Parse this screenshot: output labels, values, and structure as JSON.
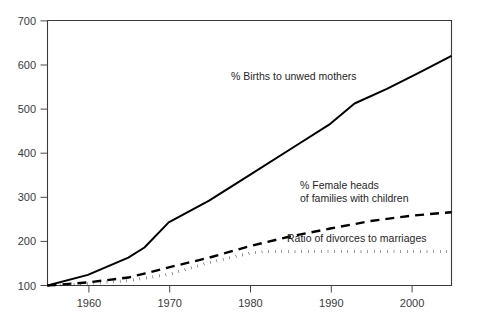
{
  "chart_data": {
    "type": "line",
    "title": "",
    "subtitle": "",
    "xlabel": "",
    "ylabel": "",
    "xlim": [
      1955,
      2005
    ],
    "ylim": [
      100,
      700
    ],
    "grid": false,
    "legend_position": "inline-annotations",
    "x_ticks": [
      "1960",
      "1970",
      "1980",
      "1990",
      "2000"
    ],
    "x_tick_values": [
      1960,
      1970,
      1980,
      1990,
      2000
    ],
    "y_ticks": [
      "100",
      "200",
      "300",
      "400",
      "500",
      "600",
      "700"
    ],
    "y_tick_values": [
      100,
      200,
      300,
      400,
      500,
      600,
      700
    ],
    "series": [
      {
        "name": "% Births to unwed mothers",
        "style": "solid",
        "x": [
          1955,
          1960,
          1965,
          1967,
          1970,
          1975,
          1980,
          1985,
          1990,
          1993,
          1997,
          2001,
          2005
        ],
        "values": [
          100,
          124,
          163,
          186,
          243,
          292,
          350,
          408,
          466,
          512,
          545,
          582,
          620
        ]
      },
      {
        "name": "% Female heads of families with children",
        "style": "dashed",
        "x": [
          1955,
          1960,
          1965,
          1967,
          1970,
          1975,
          1980,
          1985,
          1990,
          1995,
          2000,
          2005
        ],
        "values": [
          100,
          107,
          118,
          127,
          141,
          163,
          189,
          211,
          229,
          246,
          258,
          266
        ]
      },
      {
        "name": "Ratio of divorces to marriages",
        "style": "dotted",
        "x": [
          1955,
          1960,
          1965,
          1970,
          1975,
          1980,
          1982,
          1985,
          1990,
          1995,
          2000,
          2005
        ],
        "values": [
          100,
          104,
          111,
          125,
          152,
          173,
          177,
          177,
          177,
          177,
          177,
          177
        ]
      }
    ],
    "annotations": [
      {
        "id": "annotation-unwed-mothers",
        "lines": [
          "% Births to unwed mothers"
        ],
        "x": 231,
        "y": 80
      },
      {
        "id": "annotation-female-heads",
        "lines": [
          "% Female heads",
          "of families with children"
        ],
        "x": 300,
        "y": 189
      },
      {
        "id": "annotation-divorces",
        "lines": [
          "Ratio of divorces to marriages"
        ],
        "x": 287,
        "y": 242
      }
    ],
    "colors": {
      "series_line": "#000000",
      "axis": "#3b3b3b",
      "tick_label": "#3a3a3a",
      "annotation_text": "#262626",
      "background": "#ffffff"
    }
  }
}
